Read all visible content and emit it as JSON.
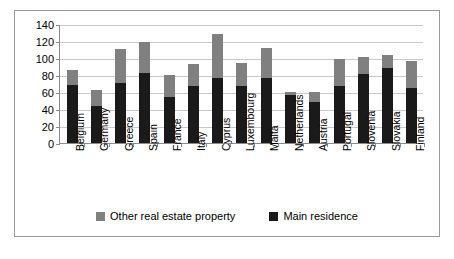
{
  "chart_data": {
    "type": "bar",
    "subtype": "stacked",
    "title": "",
    "xlabel": "",
    "ylabel": "",
    "ylim": [
      0,
      140
    ],
    "ytick_step": 20,
    "yticks": [
      0,
      20,
      40,
      60,
      80,
      100,
      120,
      140
    ],
    "grid": true,
    "legend_position": "bottom",
    "categories": [
      "Belgium",
      "Germany",
      "Greece",
      "Spain",
      "France",
      "Italy",
      "Cyprus",
      "Luxembourg",
      "Malta",
      "Netherlands",
      "Austria",
      "Portugal",
      "Slovenia",
      "Slovakia",
      "Finland"
    ],
    "series": [
      {
        "name": "Main residence",
        "color": "#1a1a1a",
        "values": [
          68,
          44,
          71,
          82,
          54,
          67,
          76,
          67,
          76,
          56,
          48,
          67,
          81,
          88,
          65
        ]
      },
      {
        "name": "Other real estate property",
        "color": "#808080",
        "values": [
          18,
          18,
          40,
          37,
          26,
          26,
          52,
          27,
          36,
          4,
          12,
          32,
          20,
          16,
          31
        ]
      }
    ],
    "totals": [
      86,
      62,
      111,
      119,
      80,
      93,
      128,
      94,
      112,
      60,
      60,
      99,
      101,
      104,
      96
    ]
  },
  "legend": {
    "entries": [
      {
        "label": "Other real estate property",
        "swatch": "#808080"
      },
      {
        "label": "Main residence",
        "swatch": "#1a1a1a"
      }
    ]
  }
}
